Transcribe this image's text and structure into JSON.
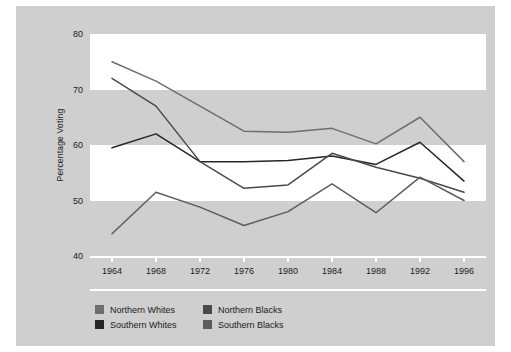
{
  "chart_data": {
    "type": "line",
    "title": "",
    "xlabel": "",
    "ylabel": "Percentage Voting",
    "ylim": [
      40,
      80
    ],
    "yticks": [
      40,
      50,
      60,
      70,
      80
    ],
    "grid": false,
    "bands": "alternating white/gray horizontal bands every 10 units",
    "legend_position": "bottom-left",
    "categories": [
      "1964",
      "1968",
      "1972",
      "1976",
      "1980",
      "1984",
      "1988",
      "1992",
      "1996"
    ],
    "x": [
      1964,
      1968,
      1972,
      1976,
      1980,
      1984,
      1988,
      1992,
      1996
    ],
    "series": [
      {
        "name": "Northern Whites",
        "color": "#6e6e6e",
        "values": [
          75.0,
          71.5,
          67.0,
          62.5,
          62.3,
          63.0,
          60.2,
          65.0,
          57.0
        ]
      },
      {
        "name": "Southern Whites",
        "color": "#262626",
        "values": [
          59.5,
          62.0,
          57.0,
          57.0,
          57.2,
          58.0,
          56.5,
          60.5,
          53.5
        ]
      },
      {
        "name": "Northern Blacks",
        "color": "#4a4a4a",
        "values": [
          72.0,
          67.0,
          57.0,
          52.2,
          52.8,
          58.5,
          56.0,
          54.0,
          51.5
        ]
      },
      {
        "name": "Southern Blacks",
        "color": "#5c5c5c",
        "values": [
          44.0,
          51.5,
          48.8,
          45.5,
          48.0,
          53.0,
          47.8,
          54.2,
          50.0
        ]
      }
    ]
  },
  "legend": {
    "items": [
      {
        "label": "Northern Whites",
        "color": "#6e6e6e"
      },
      {
        "label": "Northern Blacks",
        "color": "#4a4a4a"
      },
      {
        "label": "Southern Whites",
        "color": "#262626"
      },
      {
        "label": "Southern Blacks",
        "color": "#5c5c5c"
      }
    ]
  },
  "colors": {
    "page_background": "#ffffff",
    "card_background": "#cfcfcf",
    "band_light": "#ffffff",
    "axis_rule": "#ffffff",
    "text": "#1a1a1a"
  }
}
